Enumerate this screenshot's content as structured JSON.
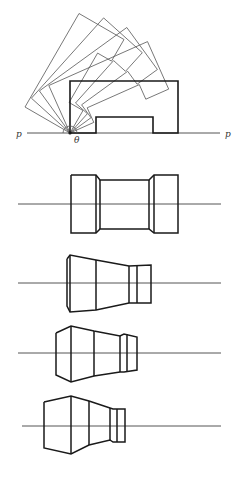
{
  "figure": {
    "width": 242,
    "height": 482,
    "colors": {
      "line": "#1a1a1a",
      "thin_line": "#555555",
      "background": "#ffffff"
    }
  },
  "rotation_diagram": {
    "baseline": {
      "x1": 27,
      "x2": 220,
      "y": 133
    },
    "labels": {
      "left_p": {
        "text": "p",
        "x": 16,
        "y": 137
      },
      "right_p": {
        "text": "p",
        "x": 225,
        "y": 137
      },
      "theta": {
        "text": "θ",
        "x": 74,
        "y": 143
      }
    },
    "pivot": {
      "x": 70,
      "y": 133
    },
    "profile_points": [
      [
        0,
        0
      ],
      [
        0,
        -52
      ],
      [
        108,
        -52
      ],
      [
        108,
        0
      ],
      [
        83,
        0
      ],
      [
        83,
        -16
      ],
      [
        26,
        -16
      ],
      [
        26,
        0
      ]
    ],
    "rotation_angles_deg": [
      60,
      48,
      36,
      24
    ]
  },
  "views": [
    {
      "name": "view-1",
      "axis": {
        "x1": 18,
        "x2": 221,
        "y": 204
      },
      "outlines": [
        [
          [
            71,
            175
          ],
          [
            96,
            175
          ],
          [
            100,
            180
          ],
          [
            149,
            180
          ],
          [
            154,
            175
          ],
          [
            178,
            175
          ],
          [
            178,
            233
          ],
          [
            154,
            233
          ],
          [
            149,
            229
          ],
          [
            100,
            229
          ],
          [
            96,
            233
          ],
          [
            71,
            233
          ],
          [
            71,
            175
          ]
        ]
      ],
      "verticals": [
        [
          [
            96,
            175
          ],
          [
            96,
            233
          ]
        ],
        [
          [
            100,
            180
          ],
          [
            100,
            229
          ]
        ],
        [
          [
            149,
            180
          ],
          [
            149,
            229
          ]
        ],
        [
          [
            154,
            175
          ],
          [
            154,
            233
          ]
        ]
      ]
    },
    {
      "name": "view-2",
      "axis": {
        "x1": 18,
        "x2": 221,
        "y": 283
      },
      "outlines": [
        [
          [
            67,
            259
          ],
          [
            70,
            255
          ],
          [
            96,
            260
          ],
          [
            129,
            266
          ],
          [
            151,
            265
          ],
          [
            151,
            303
          ],
          [
            129,
            303
          ],
          [
            96,
            310
          ],
          [
            70,
            312
          ],
          [
            67,
            306
          ],
          [
            67,
            259
          ]
        ]
      ],
      "verticals": [
        [
          [
            70,
            255
          ],
          [
            70,
            312
          ]
        ],
        [
          [
            96,
            260
          ],
          [
            96,
            310
          ]
        ],
        [
          [
            129,
            266
          ],
          [
            129,
            303
          ]
        ],
        [
          [
            137,
            265
          ],
          [
            137,
            303
          ]
        ]
      ]
    },
    {
      "name": "view-3",
      "axis": {
        "x1": 18,
        "x2": 221,
        "y": 353
      },
      "outlines": [
        [
          [
            56,
            333
          ],
          [
            71,
            326
          ],
          [
            94,
            331
          ],
          [
            120,
            336
          ],
          [
            124,
            334
          ],
          [
            137,
            337
          ],
          [
            137,
            370
          ],
          [
            124,
            372
          ],
          [
            120,
            372
          ],
          [
            94,
            376
          ],
          [
            71,
            382
          ],
          [
            56,
            375
          ],
          [
            56,
            333
          ]
        ]
      ],
      "verticals": [
        [
          [
            71,
            326
          ],
          [
            71,
            382
          ]
        ],
        [
          [
            94,
            331
          ],
          [
            94,
            376
          ]
        ],
        [
          [
            120,
            336
          ],
          [
            120,
            372
          ]
        ],
        [
          [
            127,
            334
          ],
          [
            127,
            372
          ]
        ]
      ]
    },
    {
      "name": "view-4",
      "axis": {
        "x1": 22,
        "x2": 221,
        "y": 426
      },
      "outlines": [
        [
          [
            44,
            402
          ],
          [
            71,
            396
          ],
          [
            89,
            401
          ],
          [
            110,
            408
          ],
          [
            113,
            409
          ],
          [
            125,
            409
          ],
          [
            125,
            442
          ],
          [
            113,
            442
          ],
          [
            110,
            440
          ],
          [
            89,
            445
          ],
          [
            71,
            454
          ],
          [
            44,
            448
          ],
          [
            44,
            402
          ]
        ]
      ],
      "verticals": [
        [
          [
            71,
            396
          ],
          [
            71,
            454
          ]
        ],
        [
          [
            89,
            401
          ],
          [
            89,
            445
          ]
        ],
        [
          [
            110,
            408
          ],
          [
            110,
            440
          ]
        ],
        [
          [
            117,
            409
          ],
          [
            117,
            442
          ]
        ]
      ]
    }
  ]
}
